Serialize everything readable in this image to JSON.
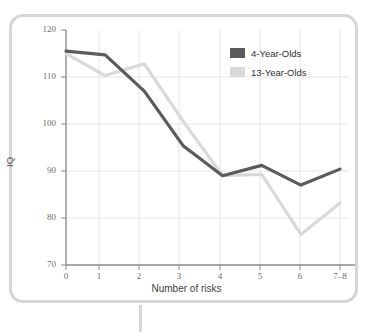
{
  "chart_data": {
    "type": "line",
    "title": "",
    "xlabel": "Number of risks",
    "ylabel": "IQ",
    "categories": [
      "0",
      "1",
      "2",
      "3",
      "4",
      "5",
      "6",
      "7–8"
    ],
    "xticks": [
      "0",
      "1",
      "2",
      "3",
      "4",
      "5",
      "6",
      "7–8"
    ],
    "yticks": [
      "70",
      "80",
      "90",
      "100",
      "110",
      "120"
    ],
    "ylim": [
      70,
      120
    ],
    "xlim": [
      0,
      7
    ],
    "grid": true,
    "legend_position": "top-right",
    "series": [
      {
        "name": "4-Year-Olds",
        "color": "#5b5b5b",
        "values": [
          115.5,
          114.7,
          107.0,
          95.3,
          89.0,
          91.2,
          87.0,
          90.4
        ]
      },
      {
        "name": "13-Year-Olds",
        "color": "#d9d9d9",
        "values": [
          115.0,
          110.3,
          112.8,
          100.5,
          89.0,
          89.3,
          76.5,
          83.2
        ]
      }
    ]
  },
  "legend": {
    "items": [
      {
        "label": "4-Year-Olds",
        "color": "#5b5b5b"
      },
      {
        "label": "13-Year-Olds",
        "color": "#d9d9d9"
      }
    ]
  },
  "axes": {
    "y_title": "IQ",
    "x_title": "Number of risks"
  },
  "style": {
    "panel_border": "#d6d6d6",
    "axis_line": "#8a8a8a",
    "grid_line": "#e3e3e3",
    "tick_text": "#6d6d6d"
  }
}
